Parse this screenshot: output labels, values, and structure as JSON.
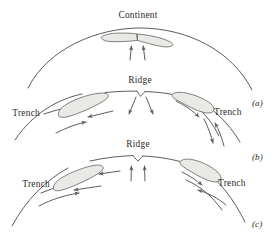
{
  "figure": {
    "title_visible": false,
    "background_color": "#ffffff",
    "width": 277,
    "height": 243,
    "line_color": "#4a4a4a",
    "slab_fill_color": "#e9e9e6",
    "slab_stroke_color": "#6b6b6b",
    "arrow_color": "#5d5d5d",
    "text_color": "#2b2b2b"
  },
  "panels": [
    {
      "id": "a",
      "panel_label": "(a)",
      "labels": [
        {
          "name": "continent",
          "text": "Continent"
        }
      ],
      "features": [
        "continent-block",
        "upwelling-arrows"
      ]
    },
    {
      "id": "b",
      "panel_label": "(b)",
      "labels": [
        {
          "name": "ridge",
          "text": "Ridge"
        },
        {
          "name": "trench-left",
          "text": "Trench"
        },
        {
          "name": "trench-right",
          "text": "Trench"
        }
      ],
      "features": [
        "spreading-ridge",
        "subducting-slab-left",
        "subducting-slab-right",
        "divergent-arrows",
        "convergence-arrows"
      ]
    },
    {
      "id": "c",
      "panel_label": "(c)",
      "labels": [
        {
          "name": "ridge",
          "text": "Ridge"
        },
        {
          "name": "trench-left",
          "text": "Trench"
        },
        {
          "name": "trench-right",
          "text": "Trench"
        }
      ],
      "features": [
        "spreading-ridge",
        "subducting-slab-left",
        "subducting-slab-right",
        "upwelling-arrows",
        "convergence-arrows"
      ]
    }
  ]
}
